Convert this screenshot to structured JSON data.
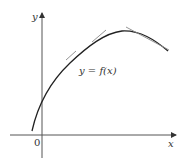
{
  "diagram": {
    "y_axis_label": "y",
    "x_axis_label": "x",
    "origin_label": "0",
    "curve_label": "y = f(x)",
    "colors": {
      "axis": "#555555",
      "curve": "#222222",
      "tangent": "#888888",
      "text": "#333333"
    }
  }
}
